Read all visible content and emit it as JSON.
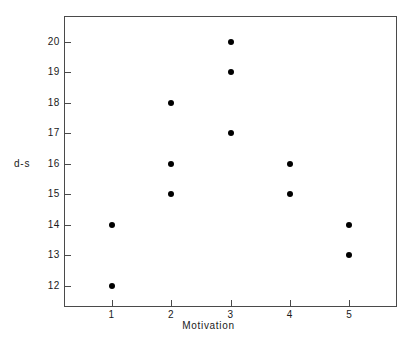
{
  "chart_data": {
    "type": "scatter",
    "title": "",
    "xlabel": "Motivation",
    "ylabel": "d-s",
    "xlim": [
      0.2,
      5.8
    ],
    "ylim": [
      11.3,
      20.85
    ],
    "grid": false,
    "legend": "none",
    "xticks": [
      1,
      2,
      3,
      4,
      5
    ],
    "xtick_labels": [
      "1",
      "2",
      "3",
      "4",
      "5"
    ],
    "yticks": [
      12,
      13,
      14,
      15,
      16,
      17,
      18,
      19,
      20
    ],
    "ytick_labels": [
      "12",
      "13",
      "14",
      "15",
      "16",
      "17",
      "18",
      "19",
      "20"
    ],
    "marker": "filled-circle",
    "marker_color": "#000000",
    "points": [
      {
        "x": 1,
        "y": 14
      },
      {
        "x": 1,
        "y": 12
      },
      {
        "x": 2,
        "y": 18
      },
      {
        "x": 2,
        "y": 16
      },
      {
        "x": 2,
        "y": 15
      },
      {
        "x": 3,
        "y": 20
      },
      {
        "x": 3,
        "y": 19
      },
      {
        "x": 3,
        "y": 17
      },
      {
        "x": 4,
        "y": 16
      },
      {
        "x": 4,
        "y": 15
      },
      {
        "x": 5,
        "y": 14
      },
      {
        "x": 5,
        "y": 13
      }
    ],
    "x": [
      1,
      1,
      2,
      2,
      2,
      3,
      3,
      3,
      4,
      4,
      5,
      5
    ],
    "y": [
      14,
      12,
      18,
      16,
      15,
      20,
      19,
      17,
      16,
      15,
      14,
      13
    ]
  },
  "caption": ""
}
